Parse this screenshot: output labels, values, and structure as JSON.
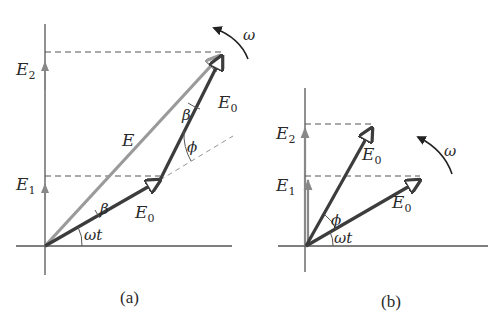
{
  "colors": {
    "axis": "#555555",
    "phasor_dark": "#3c3c3c",
    "phasor_light": "#9a9a9a",
    "dashed": "#555555",
    "text": "#2a2a2a"
  },
  "panel_a": {
    "caption": "(a)",
    "axis_labels": {
      "e2": {
        "main": "E",
        "sub": "2"
      },
      "e1": {
        "main": "E",
        "sub": "1"
      }
    },
    "vectors": {
      "resultant": {
        "main": "E",
        "sub": ""
      },
      "first_e0": {
        "main": "E",
        "sub": "0"
      },
      "second_e0": {
        "main": "E",
        "sub": "0"
      }
    },
    "angles": {
      "beta_lower": "β",
      "beta_upper": "β",
      "phi": "ϕ",
      "omega_t": "ωt"
    },
    "rotation_label": "ω"
  },
  "panel_b": {
    "caption": "(b)",
    "axis_labels": {
      "e2": {
        "main": "E",
        "sub": "2"
      },
      "e1": {
        "main": "E",
        "sub": "1"
      }
    },
    "vectors": {
      "upper_e0": {
        "main": "E",
        "sub": "0"
      },
      "lower_e0": {
        "main": "E",
        "sub": "0"
      }
    },
    "angles": {
      "phi": "ϕ",
      "omega_t": "ωt"
    },
    "rotation_label": "ω"
  }
}
